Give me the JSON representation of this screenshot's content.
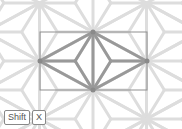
{
  "diagram": {
    "pattern": "asanoha",
    "background_color": "#ffffff",
    "lattice_color": "#dddddd",
    "highlight_color": "#999999",
    "selection_rect_color": "#8f8f8f",
    "selection_rect": {
      "x": 40,
      "y": 32,
      "width": 107,
      "height": 58
    },
    "highlighted_diamond": {
      "top": [
        93,
        32
      ],
      "left": [
        40,
        61
      ],
      "right": [
        147,
        61
      ],
      "bottom": [
        93,
        90
      ]
    }
  },
  "keys": [
    {
      "label": "Shift"
    },
    {
      "label": "X"
    }
  ]
}
